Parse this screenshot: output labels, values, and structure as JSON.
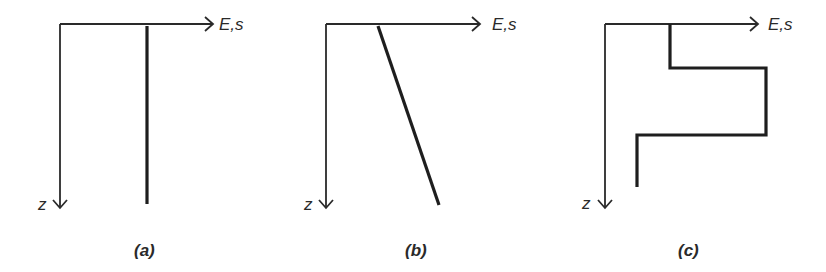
{
  "figure": {
    "panels": [
      {
        "id": "a",
        "caption": "(a)",
        "x_axis_label": "E,s",
        "z_axis_label": "z",
        "profile_shape": "constant (vertical line)",
        "axis_origin": [
          60,
          24
        ],
        "x_arrow_tip": [
          213,
          24
        ],
        "z_arrow_tip": [
          60,
          208
        ],
        "profile_points": [
          [
            147,
            26
          ],
          [
            147,
            204
          ]
        ]
      },
      {
        "id": "b",
        "caption": "(b)",
        "x_axis_label": "E,s",
        "z_axis_label": "z",
        "profile_shape": "linearly increasing with depth",
        "axis_origin": [
          326,
          24
        ],
        "x_arrow_tip": [
          480,
          24
        ],
        "z_arrow_tip": [
          326,
          208
        ],
        "profile_points": [
          [
            378,
            26
          ],
          [
            439,
            205
          ]
        ]
      },
      {
        "id": "c",
        "caption": "(c)",
        "x_axis_label": "E,s",
        "z_axis_label": "z",
        "profile_shape": "layered (stepwise)",
        "axis_origin": [
          605,
          24
        ],
        "x_arrow_tip": [
          758,
          24
        ],
        "z_arrow_tip": [
          605,
          208
        ],
        "profile_points": [
          [
            670,
            24
          ],
          [
            670,
            68
          ],
          [
            766,
            68
          ],
          [
            766,
            135
          ],
          [
            637,
            135
          ],
          [
            637,
            187
          ]
        ]
      }
    ]
  }
}
